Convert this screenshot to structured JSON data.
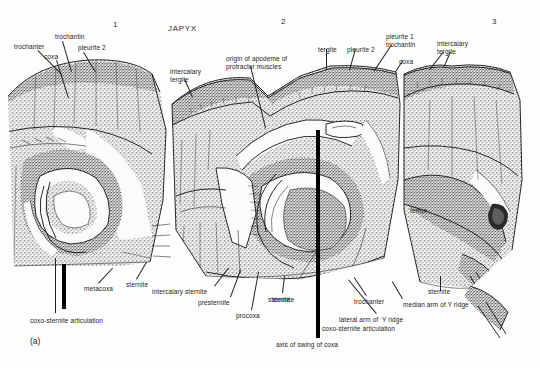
{
  "figure": {
    "title": "JAPYX",
    "caption": "(a)",
    "segment_numerals": [
      "1",
      "2",
      "3"
    ]
  },
  "labels": {
    "top": [
      {
        "text": "trochanter",
        "x": 14,
        "y": 43,
        "align": "left"
      },
      {
        "text": "trochantin",
        "x": 55,
        "y": 33,
        "align": "left"
      },
      {
        "text": "coxa",
        "x": 44,
        "y": 53,
        "align": "left"
      },
      {
        "text": "pleurite 2",
        "x": 78,
        "y": 44,
        "align": "left"
      },
      {
        "text": "intercalary",
        "x": 170,
        "y": 68,
        "align": "left"
      },
      {
        "text": "tergite",
        "x": 170,
        "y": 76,
        "align": "left"
      },
      {
        "text": "origin of apodeme of",
        "x": 226,
        "y": 55,
        "align": "left"
      },
      {
        "text": "protractor muscles",
        "x": 226,
        "y": 63,
        "align": "left"
      },
      {
        "text": "tergite",
        "x": 318,
        "y": 46,
        "align": "left"
      },
      {
        "text": "pleurite 2",
        "x": 347,
        "y": 46,
        "align": "left"
      },
      {
        "text": "pleurite 1",
        "x": 386,
        "y": 33,
        "align": "left"
      },
      {
        "text": "trochantin",
        "x": 386,
        "y": 41,
        "align": "left"
      },
      {
        "text": "coxa",
        "x": 399,
        "y": 58,
        "align": "left"
      },
      {
        "text": "intercalary",
        "x": 437,
        "y": 40,
        "align": "left"
      },
      {
        "text": "tergite",
        "x": 437,
        "y": 48,
        "align": "left"
      }
    ],
    "inner": [
      {
        "text": "femur",
        "x": 410,
        "y": 207,
        "align": "left"
      }
    ],
    "bottom": [
      {
        "text": "metacoxa",
        "x": 84,
        "y": 285,
        "align": "left"
      },
      {
        "text": "sternite",
        "x": 126,
        "y": 281,
        "align": "left"
      },
      {
        "text": "coxo-sternite articulation",
        "x": 30,
        "y": 317,
        "align": "left"
      },
      {
        "text": "intercalary sternite",
        "x": 152,
        "y": 288,
        "align": "left"
      },
      {
        "text": "presternite",
        "x": 198,
        "y": 299,
        "align": "left"
      },
      {
        "text": "procoxa",
        "x": 236,
        "y": 312,
        "align": "left"
      },
      {
        "text": "sternite",
        "x": 268,
        "y": 296,
        "align": "left"
      },
      {
        "text": "sternite",
        "x": 272,
        "y": 296,
        "align": "left"
      },
      {
        "text": "trochanter",
        "x": 354,
        "y": 298,
        "align": "left"
      },
      {
        "text": "lateral arm of  Y ridge",
        "x": 339,
        "y": 316,
        "align": "left"
      },
      {
        "text": "coxo-sternite articulation",
        "x": 322,
        "y": 325,
        "align": "left"
      },
      {
        "text": "axis of swing of coxa",
        "x": 276,
        "y": 341,
        "align": "left"
      },
      {
        "text": "median arm of Y ridge",
        "x": 403,
        "y": 301,
        "align": "left"
      },
      {
        "text": "sternite",
        "x": 428,
        "y": 288,
        "align": "left"
      }
    ]
  },
  "leaders": [
    {
      "x1": 38,
      "y1": 50,
      "x2": 62,
      "y2": 74
    },
    {
      "x1": 63,
      "y1": 41,
      "x2": 72,
      "y2": 72
    },
    {
      "x1": 57,
      "y1": 60,
      "x2": 69,
      "y2": 98
    },
    {
      "x1": 84,
      "y1": 52,
      "x2": 96,
      "y2": 72
    },
    {
      "x1": 185,
      "y1": 79,
      "x2": 193,
      "y2": 97
    },
    {
      "x1": 251,
      "y1": 66,
      "x2": 266,
      "y2": 128
    },
    {
      "x1": 327,
      "y1": 49,
      "x2": 327,
      "y2": 70
    },
    {
      "x1": 356,
      "y1": 49,
      "x2": 350,
      "y2": 70
    },
    {
      "x1": 392,
      "y1": 45,
      "x2": 374,
      "y2": 72
    },
    {
      "x1": 403,
      "y1": 61,
      "x2": 396,
      "y2": 72
    },
    {
      "x1": 444,
      "y1": 52,
      "x2": 430,
      "y2": 70
    },
    {
      "x1": 451,
      "y1": 52,
      "x2": 444,
      "y2": 68
    },
    {
      "x1": 98,
      "y1": 283,
      "x2": 112,
      "y2": 268
    },
    {
      "x1": 136,
      "y1": 279,
      "x2": 146,
      "y2": 262
    },
    {
      "x1": 55,
      "y1": 313,
      "x2": 55,
      "y2": 258
    },
    {
      "x1": 214,
      "y1": 286,
      "x2": 228,
      "y2": 268
    },
    {
      "x1": 230,
      "y1": 297,
      "x2": 240,
      "y2": 270
    },
    {
      "x1": 251,
      "y1": 310,
      "x2": 258,
      "y2": 272
    },
    {
      "x1": 282,
      "y1": 293,
      "x2": 284,
      "y2": 276
    },
    {
      "x1": 366,
      "y1": 296,
      "x2": 354,
      "y2": 278
    },
    {
      "x1": 376,
      "y1": 314,
      "x2": 348,
      "y2": 280
    },
    {
      "x1": 402,
      "y1": 299,
      "x2": 392,
      "y2": 282
    },
    {
      "x1": 440,
      "y1": 291,
      "x2": 440,
      "y2": 276
    }
  ],
  "axis_markers": [
    {
      "name": "coxo-sternite-articulation-marker-left",
      "x": 62,
      "y": 264,
      "w": 3.5,
      "h": 45
    },
    {
      "name": "axis-of-swing-of-coxa-marker-center",
      "x": 316,
      "y": 130,
      "w": 4,
      "h": 208
    }
  ],
  "colors": {
    "ink": "#111111",
    "text": "#1b1b1b",
    "background": "#fdfdfd",
    "stipple_dark": "#3a3a3a"
  }
}
